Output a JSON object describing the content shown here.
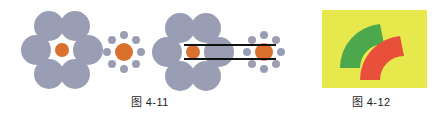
{
  "figures": [
    {
      "id": "figure-4-11",
      "caption": "图 4-11",
      "illusion_name": "Ebbinghaus illusion",
      "clusters": [
        {
          "id": "cluster-large-surround",
          "center_circle": {
            "color": "#d9702e",
            "radius": 7,
            "cx": 62,
            "cy": 50
          },
          "surround_circles": {
            "color": "#9a9eb4",
            "radius": 15,
            "count": 6,
            "orbit_radius": 26
          }
        },
        {
          "id": "cluster-small-surround",
          "center_circle": {
            "color": "#d9702e",
            "radius": 9,
            "cx": 124,
            "cy": 52
          },
          "surround_circles": {
            "color": "#9a9eb4",
            "radius": 4,
            "count": 8,
            "orbit_radius": 17
          }
        },
        {
          "id": "cluster-large-surround-measured",
          "center_circle": {
            "color": "#d9702e",
            "radius": 7,
            "cx": 193,
            "cy": 52
          },
          "surround_circles": {
            "color": "#9a9eb4",
            "radius": 15,
            "count": 6,
            "orbit_radius": 26
          }
        },
        {
          "id": "cluster-small-surround-measured",
          "center_circle": {
            "color": "#d9702e",
            "radius": 9,
            "cx": 264,
            "cy": 52
          },
          "surround_circles": {
            "color": "#9a9eb4",
            "radius": 4,
            "count": 8,
            "orbit_radius": 17
          }
        }
      ],
      "measurement_lines": {
        "color": "#12120f",
        "thickness": 2,
        "x_start": 184,
        "x_end": 276,
        "y_top": 45,
        "y_bottom": 59
      }
    },
    {
      "id": "figure-4-12",
      "caption": "图 4-12",
      "illusion_name": "Jastrow illusion",
      "background_color": "#e6e84b",
      "arcs": [
        {
          "id": "arc-green",
          "color": "#4ca84c",
          "position": "upper-left"
        },
        {
          "id": "arc-red",
          "color": "#e8503c",
          "position": "lower-right"
        }
      ]
    }
  ]
}
